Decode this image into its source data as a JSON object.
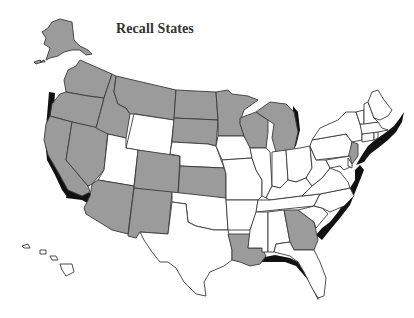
{
  "title": "Recall States",
  "colors": {
    "recall_fill": "#9b9b9b",
    "other_fill": "#ffffff",
    "border": "#3a3a3a",
    "shadow": "#111111",
    "background": "#ffffff"
  },
  "recall_states": [
    "AK",
    "WA",
    "OR",
    "CA",
    "NV",
    "ID",
    "MT",
    "AZ",
    "NM",
    "CO",
    "ND",
    "SD",
    "KS",
    "MN",
    "WI",
    "MI",
    "LA",
    "GA",
    "NJ"
  ],
  "states": [
    {
      "code": "AK",
      "name": "Alaska",
      "recall": true
    },
    {
      "code": "HI",
      "name": "Hawaii",
      "recall": false
    },
    {
      "code": "WA",
      "name": "Washington",
      "recall": true
    },
    {
      "code": "OR",
      "name": "Oregon",
      "recall": true
    },
    {
      "code": "CA",
      "name": "California",
      "recall": true
    },
    {
      "code": "NV",
      "name": "Nevada",
      "recall": true
    },
    {
      "code": "ID",
      "name": "Idaho",
      "recall": true
    },
    {
      "code": "MT",
      "name": "Montana",
      "recall": true
    },
    {
      "code": "WY",
      "name": "Wyoming",
      "recall": false
    },
    {
      "code": "UT",
      "name": "Utah",
      "recall": false
    },
    {
      "code": "AZ",
      "name": "Arizona",
      "recall": true
    },
    {
      "code": "CO",
      "name": "Colorado",
      "recall": true
    },
    {
      "code": "NM",
      "name": "New Mexico",
      "recall": true
    },
    {
      "code": "ND",
      "name": "North Dakota",
      "recall": true
    },
    {
      "code": "SD",
      "name": "South Dakota",
      "recall": true
    },
    {
      "code": "NE",
      "name": "Nebraska",
      "recall": false
    },
    {
      "code": "KS",
      "name": "Kansas",
      "recall": true
    },
    {
      "code": "OK",
      "name": "Oklahoma",
      "recall": false
    },
    {
      "code": "TX",
      "name": "Texas",
      "recall": false
    },
    {
      "code": "MN",
      "name": "Minnesota",
      "recall": true
    },
    {
      "code": "IA",
      "name": "Iowa",
      "recall": false
    },
    {
      "code": "MO",
      "name": "Missouri",
      "recall": false
    },
    {
      "code": "AR",
      "name": "Arkansas",
      "recall": false
    },
    {
      "code": "LA",
      "name": "Louisiana",
      "recall": true
    },
    {
      "code": "WI",
      "name": "Wisconsin",
      "recall": true
    },
    {
      "code": "IL",
      "name": "Illinois",
      "recall": false
    },
    {
      "code": "MI",
      "name": "Michigan",
      "recall": true
    },
    {
      "code": "IN",
      "name": "Indiana",
      "recall": false
    },
    {
      "code": "OH",
      "name": "Ohio",
      "recall": false
    },
    {
      "code": "KY",
      "name": "Kentucky",
      "recall": false
    },
    {
      "code": "TN",
      "name": "Tennessee",
      "recall": false
    },
    {
      "code": "MS",
      "name": "Mississippi",
      "recall": false
    },
    {
      "code": "AL",
      "name": "Alabama",
      "recall": false
    },
    {
      "code": "GA",
      "name": "Georgia",
      "recall": true
    },
    {
      "code": "FL",
      "name": "Florida",
      "recall": false
    },
    {
      "code": "SC",
      "name": "South Carolina",
      "recall": false
    },
    {
      "code": "NC",
      "name": "North Carolina",
      "recall": false
    },
    {
      "code": "VA",
      "name": "Virginia",
      "recall": false
    },
    {
      "code": "WV",
      "name": "West Virginia",
      "recall": false
    },
    {
      "code": "PA",
      "name": "Pennsylvania",
      "recall": false
    },
    {
      "code": "NY",
      "name": "New York",
      "recall": false
    },
    {
      "code": "NJ",
      "name": "New Jersey",
      "recall": true
    },
    {
      "code": "MD",
      "name": "Maryland",
      "recall": false
    },
    {
      "code": "DE",
      "name": "Delaware",
      "recall": false
    },
    {
      "code": "CT",
      "name": "Connecticut",
      "recall": false
    },
    {
      "code": "RI",
      "name": "Rhode Island",
      "recall": false
    },
    {
      "code": "MA",
      "name": "Massachusetts",
      "recall": false
    },
    {
      "code": "VT",
      "name": "Vermont",
      "recall": false
    },
    {
      "code": "NH",
      "name": "New Hampshire",
      "recall": false
    },
    {
      "code": "ME",
      "name": "Maine",
      "recall": false
    }
  ]
}
